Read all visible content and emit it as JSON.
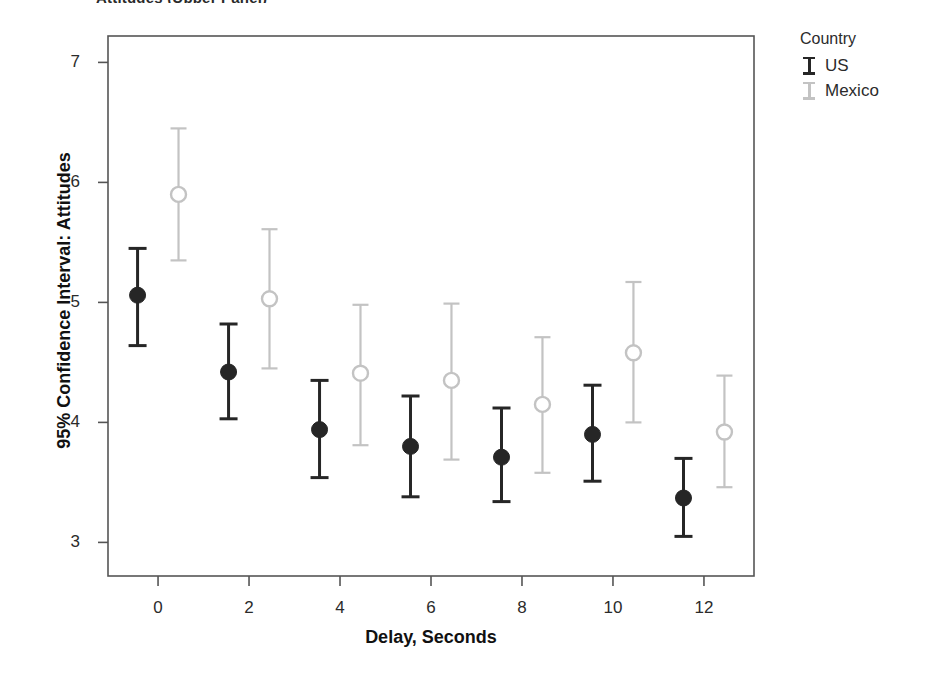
{
  "title_fragment": "Attitudes (Upper Panel)",
  "legend": {
    "title": "Country",
    "entries": [
      {
        "label": "US",
        "color": "#262626"
      },
      {
        "label": "Mexico",
        "color": "#c3c3c3"
      }
    ]
  },
  "chart_data": {
    "type": "scatter",
    "title": "",
    "xlabel": "Delay, Seconds",
    "ylabel": "95% Confidence Interval: Attitudes",
    "xlim": [
      -1.1,
      13.1
    ],
    "ylim": [
      2.72,
      7.22
    ],
    "xticks": [
      0,
      2,
      4,
      6,
      8,
      10,
      12
    ],
    "yticks": [
      3,
      4,
      5,
      6,
      7
    ],
    "grid": false,
    "legend_position": "right",
    "error_bars": "95% confidence interval",
    "series": [
      {
        "name": "US",
        "color": "#262626",
        "marker": "filled-circle",
        "points": [
          {
            "x": -0.45,
            "y": 5.06,
            "low": 4.64,
            "high": 5.45
          },
          {
            "x": 1.55,
            "y": 4.42,
            "low": 4.03,
            "high": 4.82
          },
          {
            "x": 3.55,
            "y": 3.94,
            "low": 3.54,
            "high": 4.35
          },
          {
            "x": 5.55,
            "y": 3.8,
            "low": 3.38,
            "high": 4.22
          },
          {
            "x": 7.55,
            "y": 3.71,
            "low": 3.34,
            "high": 4.12
          },
          {
            "x": 9.55,
            "y": 3.9,
            "low": 3.51,
            "high": 4.31
          },
          {
            "x": 11.55,
            "y": 3.37,
            "low": 3.05,
            "high": 3.7
          }
        ]
      },
      {
        "name": "Mexico",
        "color": "#c3c3c3",
        "marker": "open-circle",
        "points": [
          {
            "x": 0.45,
            "y": 5.9,
            "low": 5.35,
            "high": 6.45
          },
          {
            "x": 2.45,
            "y": 5.03,
            "low": 4.45,
            "high": 5.61
          },
          {
            "x": 4.45,
            "y": 4.41,
            "low": 3.81,
            "high": 4.98
          },
          {
            "x": 6.45,
            "y": 4.35,
            "low": 3.69,
            "high": 4.99
          },
          {
            "x": 8.45,
            "y": 4.15,
            "low": 3.58,
            "high": 4.71
          },
          {
            "x": 10.45,
            "y": 4.58,
            "low": 4.0,
            "high": 5.17
          },
          {
            "x": 12.45,
            "y": 3.92,
            "low": 3.46,
            "high": 4.39
          }
        ]
      }
    ]
  },
  "plot_frame": {
    "left": 108,
    "right": 754,
    "top": 36,
    "bottom": 576,
    "border_color": "#555555"
  }
}
